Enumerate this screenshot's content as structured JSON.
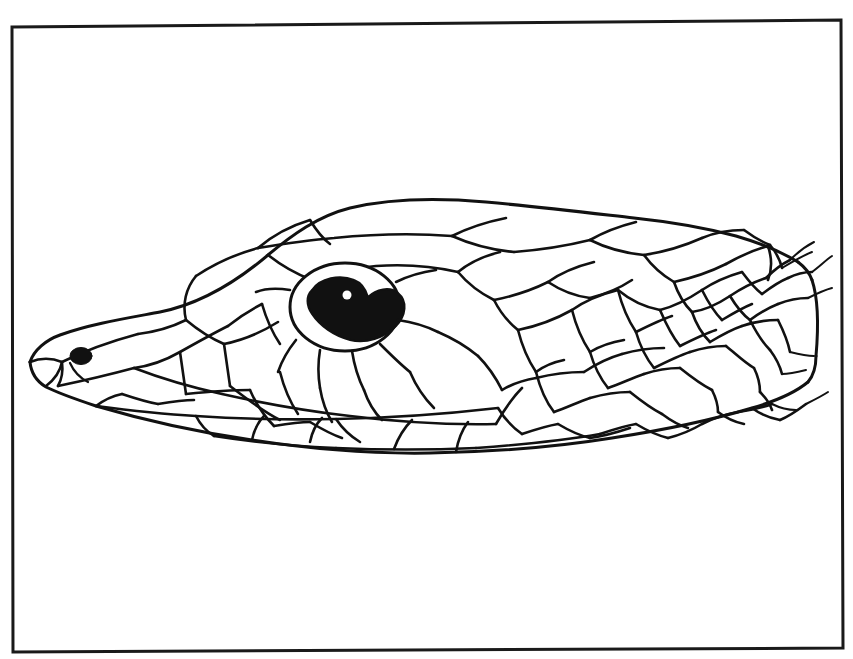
{
  "document": {
    "kind": "scientific-line-drawing",
    "subject": "snake head, lateral view",
    "caption": "",
    "background_color": "#ffffff",
    "ink_color": "#111111"
  },
  "frame": {
    "name": "figure-border",
    "stroke_color": "#1a1a1a",
    "stroke_width": 3,
    "x": 11,
    "y": 21,
    "width": 831,
    "height": 628,
    "skew_note": "slightly rotated, scan artifact"
  },
  "artifacts": {
    "top_speck": {
      "x": 104,
      "y": 1,
      "w": 4,
      "h": 7
    },
    "right_speck": {
      "x": 806,
      "y": 232,
      "w": 3,
      "h": 3
    }
  },
  "illustration": {
    "name": "snake-head-lateral",
    "outline_stroke": "#111111",
    "features": [
      {
        "name": "snout-tip",
        "x": 30,
        "y": 362
      },
      {
        "name": "nostril",
        "x": 81,
        "y": 356,
        "fill": "#111111",
        "rx": 11,
        "ry": 8
      },
      {
        "name": "eye-socket-outline",
        "cx": 345,
        "cy": 307,
        "rx": 54,
        "ry": 43
      },
      {
        "name": "eye-pupil",
        "fill": "#111111"
      },
      {
        "name": "eye-highlight",
        "cx": 346,
        "cy": 296,
        "r": 4,
        "fill": "#ffffff"
      },
      {
        "name": "dorsal-head-ridge"
      },
      {
        "name": "supralabial-scale-row"
      },
      {
        "name": "infralabial-scale-row"
      },
      {
        "name": "body-scale-rows"
      }
    ],
    "scale_count_note": "imbricate dorsal body scales tapering posteriorly"
  },
  "colors": {
    "ink": "#111111",
    "paper": "#ffffff",
    "frame": "#1a1a1a",
    "eye_fill": "#111111",
    "eye_highlight": "#ffffff"
  }
}
